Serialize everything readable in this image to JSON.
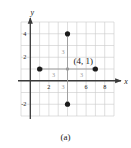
{
  "figure": {
    "caption": "(a)",
    "point_label": "(4, 1)",
    "axis_label_x": "x",
    "axis_label_y": "y"
  },
  "colors": {
    "grid": "#c9c9c9",
    "axis": "#3a3a3a",
    "point": "#1a1a1a",
    "arrow": "#9a9a9a",
    "distance_label": "#9a9a9a",
    "text": "#1a1a1a",
    "background": "#ffffff"
  },
  "chart_data": {
    "type": "scatter",
    "title": "",
    "xlabel": "x",
    "ylabel": "y",
    "xlim": [
      -1,
      9
    ],
    "ylim": [
      -3,
      5
    ],
    "grid": true,
    "legend": false,
    "x_ticks": [
      2,
      6,
      8
    ],
    "x_tick_labels": [
      "2",
      "6",
      "8"
    ],
    "y_ticks": [
      4,
      2,
      -2
    ],
    "y_tick_labels": [
      "4",
      "2",
      "-2"
    ],
    "center_point": {
      "x": 4,
      "y": 1,
      "label": "(4, 1)",
      "filled": false
    },
    "points": [
      {
        "name": "left-point",
        "x": 1,
        "y": 1
      },
      {
        "name": "right-point",
        "x": 7,
        "y": 1
      },
      {
        "name": "top-point",
        "x": 4,
        "y": 4
      },
      {
        "name": "bottom-point",
        "x": 4,
        "y": -2
      }
    ],
    "distance_arrows": [
      {
        "name": "arrow-left",
        "from": [
          4,
          1
        ],
        "to": [
          1,
          1
        ],
        "label": "3"
      },
      {
        "name": "arrow-right",
        "from": [
          4,
          1
        ],
        "to": [
          7,
          1
        ],
        "label": "3"
      },
      {
        "name": "arrow-up",
        "from": [
          4,
          1
        ],
        "to": [
          4,
          4
        ],
        "label": "3"
      },
      {
        "name": "arrow-down",
        "from": [
          4,
          1
        ],
        "to": [
          4,
          -2
        ],
        "label": "3"
      }
    ]
  }
}
